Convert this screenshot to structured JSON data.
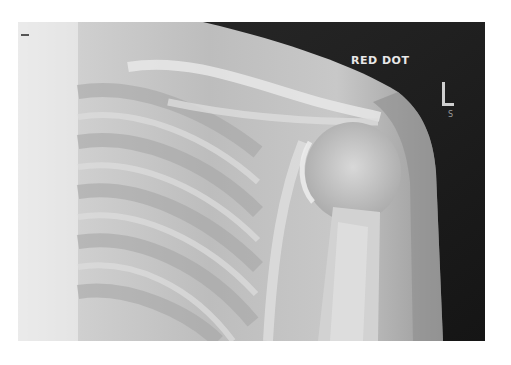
{
  "image": {
    "subject": "shoulder radiograph",
    "annotations": {
      "marker_text": "RED DOT",
      "side_marker": "L",
      "side_marker_sub": "S"
    }
  }
}
